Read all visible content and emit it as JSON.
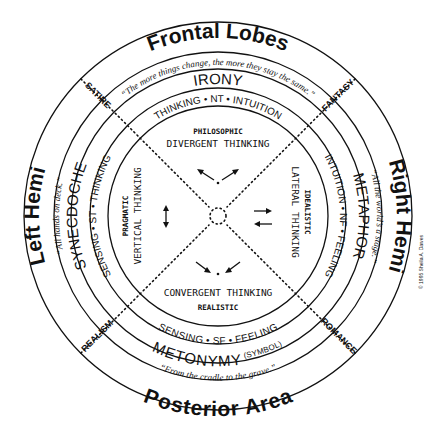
{
  "regions": {
    "top": "Frontal Lobes",
    "bottom": "Posterior Area",
    "left": "Left Hemi",
    "right": "Right Hemi"
  },
  "quotes": {
    "top": "“The more things change, the more they stay the same.”",
    "bottom": "“From the cradle to the grave.”",
    "left": "“All hands on deck.”",
    "right": "“All the world’s a stage.”"
  },
  "tropes": {
    "top": "IRONY",
    "bottom": "METONYMY",
    "bottom_note": "(SYMBOL)",
    "left": "SYNECDOCHE",
    "right": "METAPHOR"
  },
  "types": {
    "top": "THINKING • NT • INTUITION",
    "bottom": "SENSING • SF • FEELING",
    "left": "SENSING • ST • THINKING",
    "right": "INTUITION • NF • FEELING"
  },
  "genres": {
    "top_left": "SATIRE",
    "top_right": "FANTASY",
    "bottom_left": "REALISM",
    "bottom_right": "ROMANCE"
  },
  "thinking": {
    "top": {
      "label": "DIVERGENT THINKING",
      "sub": "PHILOSOPHIC"
    },
    "bottom": {
      "label": "CONVERGENT THINKING",
      "sub": "REALISTIC"
    },
    "left": {
      "label": "VERTICAL THINKING",
      "sub": "PRAGMATIC"
    },
    "right": {
      "label": "LATERAL THINKING",
      "sub": "IDEALISTIC"
    }
  },
  "copyright": "© 1995 Sheila A. Dawes"
}
